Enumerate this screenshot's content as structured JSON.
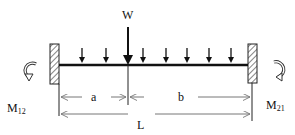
{
  "diagram": {
    "labels": {
      "point_load": "W",
      "left_moment": "M",
      "left_moment_sub": "12",
      "right_moment": "M",
      "right_moment_sub": "21",
      "dim_a": "a",
      "dim_b": "b",
      "dim_L": "L"
    },
    "supports": [
      {
        "side": "left",
        "type": "fixed"
      },
      {
        "side": "right",
        "type": "fixed"
      }
    ],
    "loads": {
      "point_load_position": "a from left support",
      "distributed_arrow_count": 7
    },
    "colors": {
      "ink": "#111111",
      "dimension": "#777777",
      "background": "#ffffff"
    }
  }
}
